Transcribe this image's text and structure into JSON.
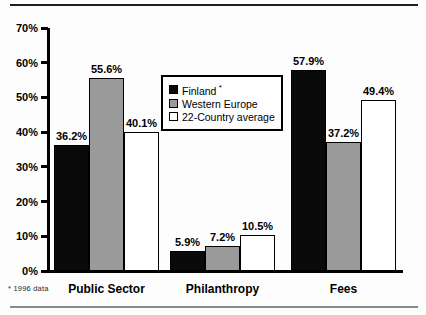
{
  "chart_data": {
    "type": "bar",
    "title": "",
    "categories": [
      "Public Sector",
      "Philanthropy",
      "Fees"
    ],
    "series": [
      {
        "name": "Finland",
        "name_suffix": "*",
        "color": "#0a0a0a",
        "values": [
          36.2,
          5.9,
          57.9
        ]
      },
      {
        "name": "Western Europe",
        "name_suffix": "",
        "color": "#9a9a9a",
        "values": [
          55.6,
          7.2,
          37.2
        ]
      },
      {
        "name": "22-Country average",
        "name_suffix": "",
        "color": "#ffffff",
        "values": [
          40.1,
          10.5,
          49.4
        ]
      }
    ],
    "data_label_format": "one-decimal-percent",
    "xlabel": "",
    "ylabel": "",
    "ylim": [
      0,
      70
    ],
    "ytick_step": 10,
    "ytick_labels": [
      "0%",
      "10%",
      "20%",
      "30%",
      "40%",
      "50%",
      "60%",
      "70%"
    ],
    "grid": false,
    "legend_position": "inside-top-center"
  },
  "footnote": "* 1996 data",
  "colors": {
    "axis": "#000000",
    "bar_border": "#000000",
    "top_rule": "#1f1f1f",
    "bottom_rule": "#8a8a8a",
    "background": "#fdfdfd"
  }
}
